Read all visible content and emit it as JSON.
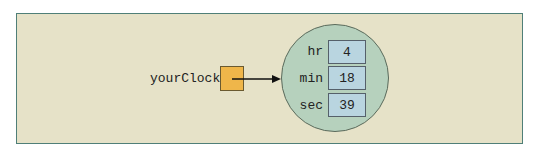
{
  "diagram": {
    "reference": {
      "name": "yourClock"
    },
    "object": {
      "fields": [
        {
          "name": "hr",
          "value": "4"
        },
        {
          "name": "min",
          "value": "18"
        },
        {
          "name": "sec",
          "value": "39"
        }
      ]
    },
    "colors": {
      "background": "#e6e2c8",
      "frame_border": "#4f7f78",
      "reference_box": "#efb64a",
      "object_circle": "#b6d1bd",
      "field_box": "#b9d5e0"
    }
  }
}
